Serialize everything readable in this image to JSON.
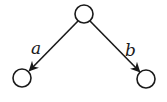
{
  "diagram": {
    "type": "tree",
    "nodes": [
      {
        "id": "root",
        "cx": 84,
        "cy": 14,
        "r": 9
      },
      {
        "id": "left-child",
        "cx": 22,
        "cy": 78,
        "r": 9
      },
      {
        "id": "right-child",
        "cx": 146,
        "cy": 79,
        "r": 9
      }
    ],
    "edges": [
      {
        "from": "root",
        "to": "left-child",
        "label": "a",
        "directed": true
      },
      {
        "from": "root",
        "to": "right-child",
        "label": "b",
        "directed": true
      }
    ],
    "labels": {
      "a": "a",
      "b": "b"
    },
    "colors": {
      "stroke": "#1a1a1a",
      "background": "#ffffff"
    }
  }
}
